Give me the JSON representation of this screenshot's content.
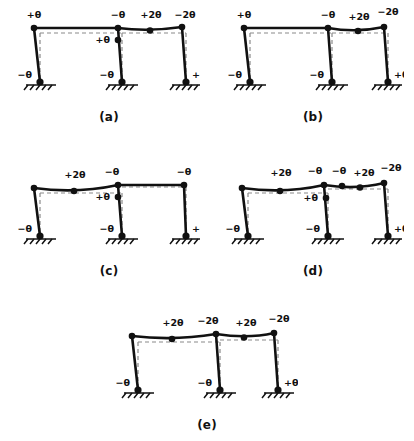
{
  "figure": {
    "symbol": "θ",
    "colors": {
      "deformed": "#111111",
      "undeformed": "#8a8a8a",
      "joint": "#111111",
      "ground": "#111111",
      "background": "#ffffff"
    }
  },
  "panels": [
    {
      "id": "a",
      "caption": "(a)",
      "labels": {
        "top_left": "+θ",
        "top_mid_left": "−θ",
        "top_mid_right": "+2θ",
        "top_right": "−2θ",
        "mid_column": "+θ",
        "base_left": "−θ",
        "base_mid": "−θ",
        "base_right": "+θ"
      }
    },
    {
      "id": "b",
      "caption": "(b)",
      "labels": {
        "top_left": "+θ",
        "top_mid_left": "−θ",
        "top_mid_right": "+2θ",
        "top_right": "−2θ",
        "mid_column": "",
        "base_left": "−θ",
        "base_mid": "−θ",
        "base_right": "+θ"
      }
    },
    {
      "id": "c",
      "caption": "(c)",
      "labels": {
        "top_left": "+2θ",
        "top_mid_left": "−θ",
        "top_mid_right": "",
        "top_right": "−θ",
        "mid_column": "+θ",
        "base_left": "−θ",
        "base_mid": "−θ",
        "base_right": "+θ"
      }
    },
    {
      "id": "d",
      "caption": "(d)",
      "labels": {
        "top_left": "+2θ",
        "top_mid_left": "−θ",
        "top_mid_left2": "−θ",
        "top_mid_right": "+2θ",
        "top_right": "−2θ",
        "mid_column": "+θ",
        "base_left": "−θ",
        "base_mid": "−θ",
        "base_right": "+θ"
      }
    },
    {
      "id": "e",
      "caption": "(e)",
      "labels": {
        "top_left": "+2θ",
        "top_mid_left": "−2θ",
        "top_mid_right": "+2θ",
        "top_right": "−2θ",
        "mid_column": "",
        "base_left": "−θ",
        "base_mid": "−θ",
        "base_right": "+θ"
      }
    }
  ]
}
